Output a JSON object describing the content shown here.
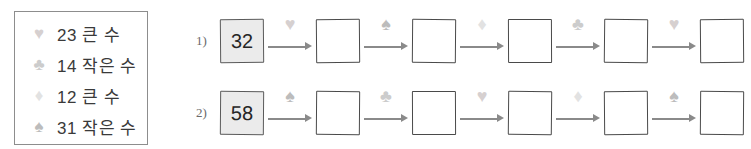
{
  "suit_glyphs": {
    "heart": "♥",
    "club": "♣",
    "diamond": "♦",
    "spade": "♠"
  },
  "suit_colors": {
    "heart": "#d6d0d0",
    "club": "#cccccc",
    "diamond": "#e2e2e2",
    "spade": "#bcbcbc"
  },
  "legend": {
    "rows": [
      {
        "suit": "♥",
        "suit_name": "heart",
        "color": "#d6d0d0",
        "text": "23 큰 수"
      },
      {
        "suit": "♣",
        "suit_name": "club",
        "color": "#cccccc",
        "text": "14 작은 수"
      },
      {
        "suit": "♦",
        "suit_name": "diamond",
        "color": "#e2e2e2",
        "text": "12 큰 수"
      },
      {
        "suit": "♠",
        "suit_name": "spade",
        "color": "#bcbcbc",
        "text": "31 작은 수"
      }
    ]
  },
  "sequences": [
    {
      "marker": "1)",
      "start_value": "32",
      "steps": [
        {
          "suit": "♥",
          "suit_name": "heart",
          "color": "#d6d0d0",
          "result": ""
        },
        {
          "suit": "♠",
          "suit_name": "spade",
          "color": "#bcbcbc",
          "result": ""
        },
        {
          "suit": "♦",
          "suit_name": "diamond",
          "color": "#e2e2e2",
          "result": ""
        },
        {
          "suit": "♣",
          "suit_name": "club",
          "color": "#cccccc",
          "result": ""
        },
        {
          "suit": "♥",
          "suit_name": "heart",
          "color": "#d6d0d0",
          "result": ""
        }
      ]
    },
    {
      "marker": "2)",
      "start_value": "58",
      "steps": [
        {
          "suit": "♠",
          "suit_name": "spade",
          "color": "#bcbcbc",
          "result": ""
        },
        {
          "suit": "♣",
          "suit_name": "club",
          "color": "#cccccc",
          "result": ""
        },
        {
          "suit": "♥",
          "suit_name": "heart",
          "color": "#d6d0d0",
          "result": ""
        },
        {
          "suit": "♦",
          "suit_name": "diamond",
          "color": "#e2e2e2",
          "result": ""
        },
        {
          "suit": "♠",
          "suit_name": "spade",
          "color": "#bcbcbc",
          "result": ""
        }
      ]
    }
  ]
}
